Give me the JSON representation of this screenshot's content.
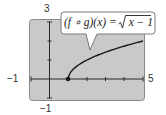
{
  "chart_data": {
    "type": "line",
    "title": "",
    "function_label": "(f ∘ g)(x) = √x − 1",
    "function_label_parts": {
      "lhs": "(f ∘ g)(x) = ",
      "radical": "√",
      "radicand": "x − 1"
    },
    "series": [
      {
        "name": "(f ∘ g)(x) = √(x − 1)",
        "x": [
          1,
          1.05,
          1.2,
          1.5,
          2,
          2.5,
          3,
          3.5,
          4,
          4.5,
          5
        ],
        "y": [
          0,
          0.224,
          0.447,
          0.707,
          1.0,
          1.225,
          1.414,
          1.581,
          1.732,
          1.871,
          2.0
        ]
      }
    ],
    "highlighted_point": {
      "x": 1,
      "y": 0,
      "style": "filled-dot"
    },
    "xlim": [
      -1,
      5
    ],
    "ylim": [
      -1,
      3
    ],
    "xticks": [
      -1,
      0,
      1,
      2,
      3,
      4,
      5
    ],
    "yticks": [
      -1,
      0,
      1,
      2,
      3
    ],
    "tick_labels": {
      "x_min": "−1",
      "x_max": "5",
      "y_min": "−1",
      "y_max": "3"
    },
    "xlabel": "",
    "ylabel": "",
    "grid": false,
    "legend": "none",
    "annotation": "callout box with pointer to curve"
  },
  "colors": {
    "screen_bg": "#c9c9c9",
    "screen_border": "#8a8a8a",
    "axis": "#2a2a2a",
    "curve": "#1a1a1a",
    "callout_bg": "#ffffff",
    "callout_border": "#7a7a7a",
    "text": "#333333"
  }
}
